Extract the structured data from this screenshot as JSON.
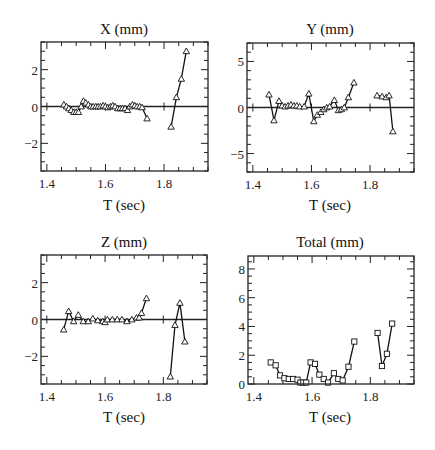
{
  "chart_data": [
    {
      "id": "x",
      "type": "line",
      "title": "X (mm)",
      "xlabel": "T (sec)",
      "ylabel": "",
      "marker": "triangle",
      "xlim": [
        1.38,
        1.95
      ],
      "ylim": [
        -3.5,
        3.5
      ],
      "xticks": [
        1.4,
        1.6,
        1.8
      ],
      "yticks": [
        -2,
        0,
        2
      ],
      "ytick_labels": [
        "−2",
        "0",
        "2"
      ],
      "zero_line": true,
      "grid": false,
      "segments": [
        {
          "x": [
            1.458,
            1.467,
            1.475,
            1.483,
            1.492,
            1.5,
            1.508,
            1.517,
            1.525,
            1.533,
            1.542,
            1.55,
            1.558,
            1.567,
            1.575,
            1.583,
            1.592,
            1.6,
            1.608,
            1.617,
            1.625,
            1.633,
            1.642,
            1.65,
            1.658,
            1.667,
            1.675,
            1.683,
            1.692,
            1.7,
            1.708,
            1.717,
            1.725,
            1.742
          ],
          "y": [
            0.1,
            0.0,
            -0.1,
            -0.2,
            -0.3,
            -0.3,
            -0.3,
            0.0,
            0.3,
            0.2,
            0.1,
            0.0,
            0.0,
            0.0,
            0.0,
            0.0,
            0.05,
            0.0,
            -0.05,
            0.0,
            0.05,
            0.0,
            -0.1,
            -0.1,
            -0.1,
            -0.1,
            -0.2,
            0.0,
            0.1,
            0.05,
            0.0,
            0.0,
            -0.05,
            -0.65
          ]
        },
        {
          "x": [
            1.824,
            1.842,
            1.859,
            1.876
          ],
          "y": [
            -1.1,
            0.5,
            1.5,
            3.0
          ]
        }
      ]
    },
    {
      "id": "y",
      "type": "line",
      "title": "Y (mm)",
      "xlabel": "T (sec)",
      "ylabel": "",
      "marker": "triangle",
      "xlim": [
        1.38,
        1.95
      ],
      "ylim": [
        -7,
        7
      ],
      "xticks": [
        1.4,
        1.6,
        1.8
      ],
      "yticks": [
        -5,
        0,
        5
      ],
      "ytick_labels": [
        "−5",
        "0",
        "5"
      ],
      "zero_line": true,
      "grid": false,
      "segments": [
        {
          "x": [
            1.455,
            1.472,
            1.489,
            1.5,
            1.51,
            1.52,
            1.53,
            1.54,
            1.55,
            1.56,
            1.575,
            1.591,
            1.608,
            1.62,
            1.632,
            1.642,
            1.652,
            1.662,
            1.678,
            1.692,
            1.702,
            1.712,
            1.726,
            1.745
          ],
          "y": [
            1.4,
            -1.4,
            0.7,
            0.2,
            0.1,
            0.2,
            0.3,
            0.2,
            0.2,
            0.1,
            0.1,
            1.5,
            -1.5,
            -0.8,
            -0.5,
            -0.2,
            0.0,
            0.1,
            0.8,
            -0.3,
            -0.2,
            0.0,
            1.1,
            2.7
          ]
        },
        {
          "x": [
            1.824,
            1.841,
            1.855,
            1.865,
            1.878
          ],
          "y": [
            1.3,
            1.2,
            1.1,
            1.3,
            -2.6
          ]
        }
      ]
    },
    {
      "id": "z",
      "type": "line",
      "title": "Z (mm)",
      "xlabel": "T (sec)",
      "ylabel": "",
      "marker": "triangle",
      "xlim": [
        1.38,
        1.95
      ],
      "ylim": [
        -3.5,
        3.5
      ],
      "xticks": [
        1.4,
        1.6,
        1.8
      ],
      "yticks": [
        -2,
        0,
        2
      ],
      "ytick_labels": [
        "−2",
        "0",
        "2"
      ],
      "zero_line": true,
      "grid": false,
      "segments": [
        {
          "x": [
            1.458,
            1.475,
            1.492,
            1.508,
            1.525,
            1.542,
            1.558,
            1.575,
            1.592,
            1.6,
            1.608,
            1.625,
            1.642,
            1.658,
            1.675,
            1.692,
            1.708,
            1.717,
            1.725,
            1.742
          ],
          "y": [
            -0.55,
            0.45,
            -0.1,
            0.25,
            -0.1,
            -0.1,
            0.05,
            -0.05,
            -0.1,
            -0.15,
            0.0,
            0.0,
            0.0,
            0.0,
            -0.1,
            0.0,
            0.1,
            0.1,
            0.35,
            1.15
          ]
        },
        {
          "x": [
            1.824,
            1.84,
            1.857,
            1.874
          ],
          "y": [
            -3.1,
            -0.3,
            0.9,
            -1.2
          ]
        }
      ]
    },
    {
      "id": "total",
      "type": "line",
      "title": "Total (mm)",
      "xlabel": "T (sec)",
      "ylabel": "",
      "marker": "square",
      "xlim": [
        1.38,
        1.95
      ],
      "ylim": [
        0,
        8.9
      ],
      "xticks": [
        1.4,
        1.6,
        1.8
      ],
      "yticks": [
        0,
        2,
        4,
        6,
        8
      ],
      "ytick_labels": [
        "0",
        "2",
        "4",
        "6",
        "8"
      ],
      "zero_line": false,
      "grid": false,
      "segments": [
        {
          "x": [
            1.458,
            1.475,
            1.49,
            1.505,
            1.52,
            1.535,
            1.55,
            1.56,
            1.57,
            1.58,
            1.595,
            1.61,
            1.625,
            1.64,
            1.655,
            1.675,
            1.69,
            1.705,
            1.725,
            1.745
          ],
          "y": [
            1.5,
            1.3,
            0.6,
            0.4,
            0.35,
            0.35,
            0.3,
            0.1,
            0.1,
            0.1,
            1.5,
            1.4,
            0.65,
            0.35,
            0.1,
            0.75,
            0.35,
            0.25,
            1.2,
            2.95
          ]
        },
        {
          "x": [
            1.825,
            1.84,
            1.857,
            1.875
          ],
          "y": [
            3.55,
            1.25,
            2.1,
            4.2
          ]
        }
      ]
    }
  ],
  "panels": {
    "x": {
      "title": "X (mm)",
      "xlabel": "T (sec)",
      "xtick_labels": [
        "1.4",
        "1.6",
        "1.8"
      ]
    },
    "y": {
      "title": "Y (mm)",
      "xlabel": "T (sec)",
      "xtick_labels": [
        "1.4",
        "1.6",
        "1.8"
      ]
    },
    "z": {
      "title": "Z (mm)",
      "xlabel": "T (sec)",
      "xtick_labels": [
        "1.4",
        "1.6",
        "1.8"
      ]
    },
    "total": {
      "title": "Total (mm)",
      "xlabel": "T (sec)",
      "xtick_labels": [
        "1.4",
        "1.6",
        "1.8"
      ]
    }
  }
}
